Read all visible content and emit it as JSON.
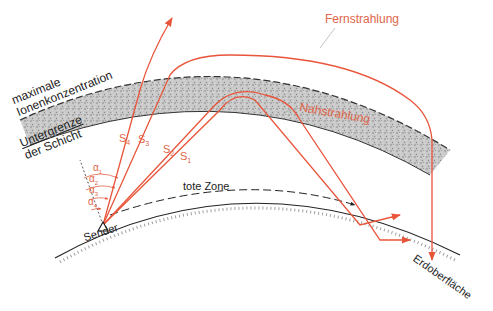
{
  "colors": {
    "ray": "#e8553a",
    "label_red": "#e0654a",
    "black": "#222222",
    "layer_fill": "#bdbdbd",
    "background": "#ffffff"
  },
  "labels": {
    "layer_top": "maximale",
    "layer_top2": "Ionenkonzentration",
    "layer_bottom": "Untergrenze",
    "layer_bottom2": "der Schicht",
    "fernstrahlung": "Fernstrahlung",
    "nahstrahlung": "Nahstrahlung",
    "tote_zone": "tote Zone",
    "sender": "Sender",
    "erdoberflaeche": "Erdoberfläche"
  },
  "rays": [
    {
      "id": "S1",
      "label": "S",
      "sub": "1"
    },
    {
      "id": "S2",
      "label": "S",
      "sub": "2"
    },
    {
      "id": "S3",
      "label": "S",
      "sub": "3"
    },
    {
      "id": "S4",
      "label": "S",
      "sub": "4"
    }
  ],
  "angles": [
    {
      "label": "α",
      "sub": "1"
    },
    {
      "label": "α",
      "sub": "2"
    },
    {
      "label": "α",
      "sub": "3"
    },
    {
      "label": "α",
      "sub": "4"
    }
  ]
}
